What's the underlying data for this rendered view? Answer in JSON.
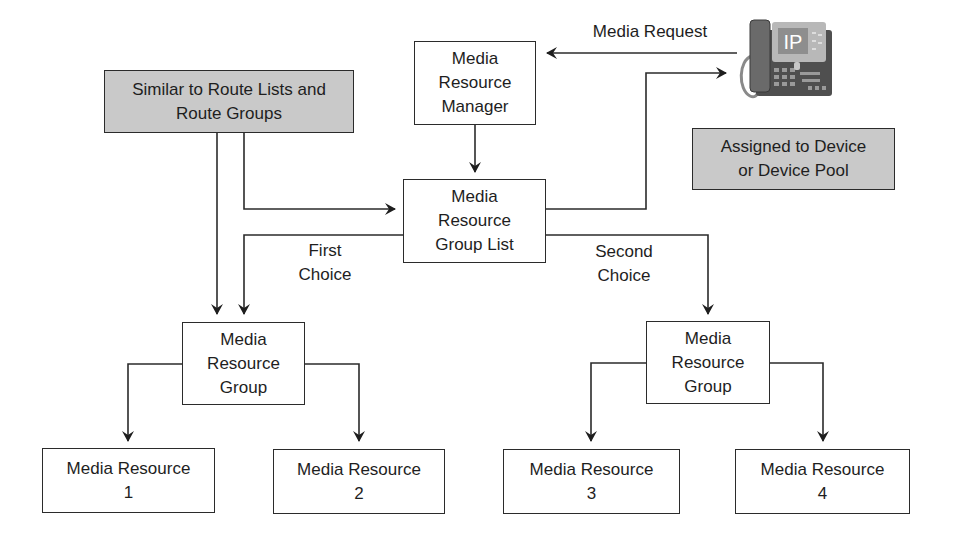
{
  "diagram": {
    "nodes": {
      "similar_note": {
        "label": "Similar to Route Lists and\nRoute Groups"
      },
      "mrm": {
        "label": "Media\nResource\nManager"
      },
      "mrgl": {
        "label": "Media\nResource\nGroup List"
      },
      "assigned_note": {
        "label": "Assigned to Device\nor Device Pool"
      },
      "mrg_left": {
        "label": "Media\nResource\nGroup"
      },
      "mrg_right": {
        "label": "Media\nResource\nGroup"
      },
      "mr1": {
        "label": "Media Resource\n1"
      },
      "mr2": {
        "label": "Media Resource\n2"
      },
      "mr3": {
        "label": "Media Resource\n3"
      },
      "mr4": {
        "label": "Media Resource\n4"
      }
    },
    "edge_labels": {
      "media_request": "Media Request",
      "first_choice": "First\nChoice",
      "second_choice": "Second\nChoice"
    },
    "phone": {
      "screen_text": "IP",
      "icon": "ip-phone-icon"
    },
    "colors": {
      "line": "#2b2b2b",
      "shaded_box": "#c9c9c9",
      "phone_body": "#5a5a5a",
      "phone_screen": "#9a9a9a"
    }
  }
}
